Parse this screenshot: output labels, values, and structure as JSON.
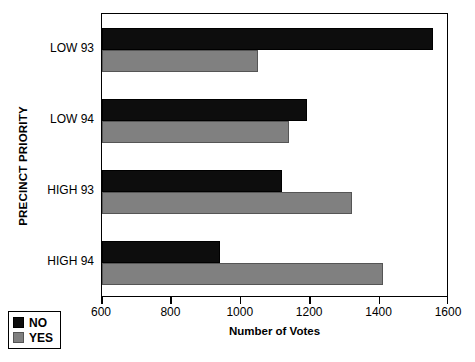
{
  "chart_data": {
    "type": "bar",
    "orientation": "horizontal",
    "title": "",
    "xlabel": "Number of Votes",
    "ylabel": "PRECINCT PRIORITY",
    "categories": [
      "LOW 93",
      "LOW 94",
      "HIGH 93",
      "HIGH 94"
    ],
    "series": [
      {
        "name": "NO",
        "color": "#0d0d0d",
        "values": [
          1555,
          1190,
          1120,
          940
        ]
      },
      {
        "name": "YES",
        "color": "#808080",
        "values": [
          1050,
          1140,
          1320,
          1410
        ]
      }
    ],
    "xlim": [
      600,
      1600
    ],
    "xticks": [
      600,
      800,
      1000,
      1200,
      1400,
      1600
    ],
    "xtick_labels": [
      "600",
      "800",
      "1000",
      "1200",
      "1400",
      "1600"
    ],
    "grid": false,
    "legend_position": "bottom-left",
    "legend_entries": [
      "NO",
      "YES"
    ]
  }
}
